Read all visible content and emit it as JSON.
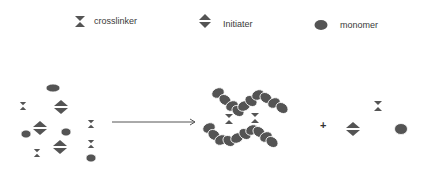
{
  "legend": {
    "items": [
      {
        "key": "crosslinker",
        "label": "crosslinker",
        "icon": "hourglass-triangles-icon"
      },
      {
        "key": "initiater",
        "label": "Initiater",
        "icon": "split-diamond-icon"
      },
      {
        "key": "monomer",
        "label": "monomer",
        "icon": "ellipse-icon"
      }
    ]
  },
  "diagram": {
    "shape_color": "#545454",
    "arrow_color": "#555555",
    "plus_label": "+",
    "reactants": {
      "crosslinkers": [
        [
          23,
          106
        ],
        [
          37,
          153
        ],
        [
          91,
          124
        ],
        [
          91,
          144
        ]
      ],
      "initiators": [
        [
          61,
          107
        ],
        [
          40,
          128
        ],
        [
          60,
          147
        ]
      ],
      "monomers": [
        [
          53,
          88
        ],
        [
          26,
          134
        ],
        [
          66,
          132
        ],
        [
          91,
          158
        ]
      ]
    },
    "arrow": {
      "x1": 112,
      "y1": 122,
      "x2": 195,
      "y2": 122
    },
    "products": {
      "polymer_network_monomers": [
        [
          218,
          93
        ],
        [
          225,
          100
        ],
        [
          232,
          106
        ],
        [
          238,
          111
        ],
        [
          244,
          106
        ],
        [
          251,
          101
        ],
        [
          258,
          95
        ],
        [
          266,
          98
        ],
        [
          274,
          103
        ],
        [
          282,
          108
        ],
        [
          209,
          128
        ],
        [
          214,
          135
        ],
        [
          221,
          140
        ],
        [
          229,
          141
        ],
        [
          237,
          138
        ],
        [
          245,
          134
        ],
        [
          252,
          130
        ],
        [
          259,
          132
        ],
        [
          266,
          137
        ],
        [
          272,
          142
        ]
      ],
      "network_crosslinkers": [
        [
          229,
          119
        ],
        [
          255,
          118
        ]
      ],
      "free_crosslinker": [
        378,
        106
      ],
      "free_initiator": [
        353,
        129
      ],
      "free_monomer": [
        401,
        129
      ]
    }
  }
}
